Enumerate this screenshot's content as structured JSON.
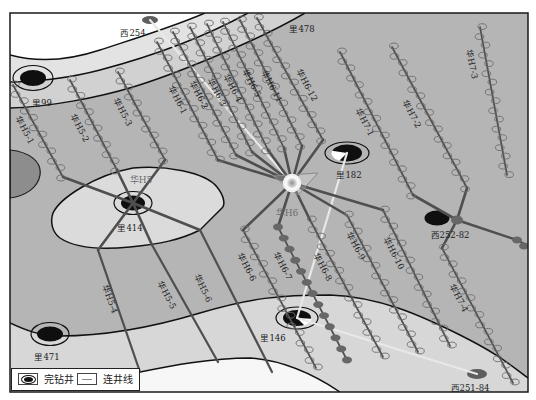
{
  "colors": {
    "trajectory": "#4f4f4f",
    "marker_stroke": "#6c6c6c",
    "marker_fill": "#676767",
    "tie_line": "#e8e8e8",
    "well_black": "#0f0f0f",
    "well_gray": "#5e5e5e",
    "pad_stroke": "#8a8a8a"
  },
  "map": {
    "frame": {
      "x": 10,
      "y": 13,
      "width": 518,
      "height": 379
    },
    "platforms": [
      {
        "name": "华H5",
        "x": 133,
        "y": 203,
        "symbol": "none",
        "label_pos": [
          141,
          180
        ]
      },
      {
        "name": "华H6",
        "x": 292,
        "y": 183,
        "symbol": "pad-glow",
        "label_pos": [
          287,
          213
        ],
        "triangle": [
          [
            273,
            176
          ],
          [
            318,
            173
          ],
          [
            298,
            195
          ]
        ]
      }
    ],
    "wells": [
      {
        "name": "西254",
        "x": 150,
        "y": 20,
        "symbol": "gray-dot",
        "core": [
          8,
          4
        ],
        "label_pos": [
          133,
          33
        ]
      },
      {
        "name": "里478",
        "symbol": "label-only",
        "label_pos": [
          302,
          29
        ]
      },
      {
        "name": "里99",
        "x": 33,
        "y": 78,
        "symbol": "ringed",
        "core": [
          13,
          8
        ],
        "ring": [
          20,
          12.5
        ],
        "label_pos": [
          42,
          103
        ]
      },
      {
        "name": "里182",
        "x": 347,
        "y": 153,
        "symbol": "ringed-pie",
        "core": [
          15,
          8.5
        ],
        "ring": [
          22,
          11
        ],
        "wedge": [
          120,
          195
        ],
        "label_pos": [
          349,
          175
        ]
      },
      {
        "name": "里414",
        "x": 133,
        "y": 203,
        "symbol": "ringed",
        "core": [
          12,
          7.5
        ],
        "ring": [
          19,
          11.5
        ],
        "label_pos": [
          130,
          228
        ]
      },
      {
        "name": "西252-82",
        "x": 437,
        "y": 218,
        "symbol": "black-dot",
        "core": [
          12.5,
          7.5
        ],
        "label_pos": [
          450,
          235
        ]
      },
      {
        "name": "里471",
        "x": 50,
        "y": 334,
        "symbol": "ringed",
        "core": [
          13,
          7.5
        ],
        "ring": [
          19,
          11.5
        ],
        "label_pos": [
          47,
          357
        ]
      },
      {
        "name": "里146",
        "x": 297,
        "y": 318,
        "symbol": "ringed-pie",
        "core": [
          14,
          8
        ],
        "ring": [
          21,
          11
        ],
        "wedge": [
          5,
          60
        ],
        "label_pos": [
          273,
          338
        ]
      },
      {
        "name": "西251-84",
        "x": 477,
        "y": 374,
        "symbol": "gray-dot",
        "core": [
          10,
          5
        ],
        "label_pos": [
          470,
          388
        ]
      }
    ],
    "horizontal_wells": [
      {
        "name": "华H5-1",
        "connector": [
          [
            133,
            203
          ],
          [
            63,
            177
          ]
        ],
        "chain": [
          [
            13,
            85
          ],
          [
            63,
            177
          ]
        ],
        "markers": "open",
        "label_pos": [
          25,
          130
        ],
        "rot": 62
      },
      {
        "name": "华H5-2",
        "connector": [
          [
            133,
            203
          ],
          [
            117,
            170
          ]
        ],
        "chain": [
          [
            70,
            80
          ],
          [
            117,
            170
          ]
        ],
        "markers": "open",
        "label_pos": [
          80,
          128
        ],
        "rot": 62
      },
      {
        "name": "华H5-3",
        "connector": [
          [
            133,
            203
          ],
          [
            165,
            160
          ]
        ],
        "chain": [
          [
            118,
            72
          ],
          [
            165,
            160
          ]
        ],
        "markers": "open",
        "label_pos": [
          123,
          112
        ],
        "rot": 62
      },
      {
        "name": "华H5-4",
        "connector": [
          [
            133,
            203
          ],
          [
            98,
            250
          ]
        ],
        "chain": [
          [
            98,
            250
          ],
          [
            140,
            372
          ]
        ],
        "markers": "none",
        "label_pos": [
          110,
          299
        ],
        "rot": 70
      },
      {
        "name": "华H5-5",
        "connector": [
          [
            133,
            203
          ],
          [
            152,
            245
          ]
        ],
        "chain": [
          [
            152,
            245
          ],
          [
            218,
            362
          ]
        ],
        "markers": "none",
        "label_pos": [
          167,
          295
        ],
        "rot": 62
      },
      {
        "name": "华H5-6",
        "connector": [
          [
            133,
            203
          ],
          [
            200,
            230
          ]
        ],
        "chain": [
          [
            200,
            230
          ],
          [
            272,
            372
          ]
        ],
        "markers": "none",
        "label_pos": [
          203,
          288
        ],
        "rot": 64
      },
      {
        "name": "华H6-1",
        "connector": [
          [
            292,
            183
          ],
          [
            218,
            160
          ]
        ],
        "chain": [
          [
            157,
            42
          ],
          [
            218,
            160
          ]
        ],
        "markers": "open",
        "label_pos": [
          178,
          100
        ],
        "rot": 62
      },
      {
        "name": "华H6-2",
        "connector": [
          [
            292,
            183
          ],
          [
            236,
            155
          ]
        ],
        "chain": [
          [
            173,
            32
          ],
          [
            236,
            155
          ]
        ],
        "markers": "open",
        "label_pos": [
          199,
          95
        ],
        "rot": 62
      },
      {
        "name": "华H6-3",
        "connector": [
          [
            292,
            183
          ],
          [
            252,
            152
          ]
        ],
        "chain": [
          [
            190,
            27
          ],
          [
            252,
            152
          ]
        ],
        "markers": "open",
        "label_pos": [
          217,
          92
        ],
        "rot": 63
      },
      {
        "name": "华H6-4",
        "connector": [
          [
            292,
            183
          ],
          [
            268,
            150
          ]
        ],
        "chain": [
          [
            207,
            24
          ],
          [
            268,
            150
          ]
        ],
        "markers": "open",
        "label_pos": [
          233,
          88
        ],
        "rot": 63
      },
      {
        "name": "华H6-5",
        "connector": [
          [
            292,
            183
          ],
          [
            284,
            148
          ]
        ],
        "chain": [
          [
            223,
            22
          ],
          [
            284,
            148
          ]
        ],
        "markers": "open",
        "label_pos": [
          252,
          83
        ],
        "rot": 63
      },
      {
        "name": "华H6-11",
        "connector": [
          [
            292,
            183
          ],
          [
            302,
            146
          ]
        ],
        "chain": [
          [
            240,
            20
          ],
          [
            302,
            146
          ]
        ],
        "markers": "open",
        "label_pos": [
          272,
          86
        ],
        "rot": 63
      },
      {
        "name": "华H6-12",
        "connector": [
          [
            292,
            183
          ],
          [
            323,
            140
          ]
        ],
        "chain": [
          [
            257,
            18
          ],
          [
            323,
            140
          ]
        ],
        "markers": "open",
        "label_pos": [
          307,
          85
        ],
        "rot": 62
      },
      {
        "name": "华H6-6",
        "connector": [
          [
            292,
            183
          ],
          [
            243,
            230
          ]
        ],
        "chain": [
          [
            243,
            230
          ],
          [
            316,
            368
          ]
        ],
        "markers": "open",
        "label_pos": [
          247,
          267
        ],
        "rot": 62
      },
      {
        "name": "华H6-7",
        "connector": [
          [
            292,
            183
          ],
          [
            278,
            227
          ]
        ],
        "chain": [
          [
            278,
            227
          ],
          [
            347,
            360
          ]
        ],
        "markers": "filled",
        "label_pos": [
          283,
          266
        ],
        "rot": 62
      },
      {
        "name": "华H6-8",
        "connector": [
          [
            292,
            183
          ],
          [
            310,
            220
          ]
        ],
        "chain": [
          [
            310,
            220
          ],
          [
            383,
            357
          ]
        ],
        "markers": "open",
        "label_pos": [
          323,
          267
        ],
        "rot": 62
      },
      {
        "name": "华H6-9",
        "connector": [
          [
            292,
            183
          ],
          [
            345,
            214
          ]
        ],
        "chain": [
          [
            347,
            215
          ],
          [
            418,
            352
          ]
        ],
        "markers": "open",
        "label_pos": [
          356,
          246
        ],
        "rot": 62
      },
      {
        "name": "华H6-10",
        "connector": [
          [
            292,
            183
          ],
          [
            383,
            210
          ]
        ],
        "chain": [
          [
            383,
            210
          ],
          [
            450,
            346
          ]
        ],
        "markers": "open",
        "label_pos": [
          394,
          253
        ],
        "rot": 63
      },
      {
        "name": "华H7-1",
        "connector": [
          [
            457,
            220
          ],
          [
            413,
            195
          ]
        ],
        "chain": [
          [
            340,
            52
          ],
          [
            413,
            195
          ]
        ],
        "markers": "open",
        "label_pos": [
          365,
          122
        ],
        "rot": 63
      },
      {
        "name": "华H7-2",
        "connector": [
          [
            457,
            220
          ],
          [
            467,
            188
          ]
        ],
        "chain": [
          [
            392,
            47
          ],
          [
            467,
            188
          ]
        ],
        "markers": "open",
        "label_pos": [
          412,
          114
        ],
        "rot": 62
      },
      {
        "name": "华H7-3",
        "connector": null,
        "chain": [
          [
            480,
            27
          ],
          [
            507,
            175
          ]
        ],
        "markers": "open",
        "label_pos": [
          472,
          64
        ],
        "rot": 78
      },
      {
        "name": "华H7-4",
        "connector": [
          [
            457,
            220
          ],
          [
            442,
            248
          ]
        ],
        "chain": [
          [
            442,
            248
          ],
          [
            513,
            383
          ]
        ],
        "markers": "open",
        "label_pos": [
          459,
          298
        ],
        "rot": 62
      }
    ],
    "junctions": [
      {
        "x": 457,
        "y": 220,
        "rx": 6,
        "ry": 4.5
      }
    ],
    "extensions": [
      {
        "path": [
          [
            457,
            220
          ],
          [
            517,
            240
          ],
          [
            528,
            246
          ]
        ],
        "dots": [
          [
            517,
            240
          ],
          [
            524,
            246
          ]
        ]
      }
    ],
    "tie_lines": [
      {
        "from": [
          150,
          20
        ],
        "to": [
          292,
          183
        ]
      },
      {
        "from": [
          347,
          153
        ],
        "to": [
          297,
          318
        ]
      },
      {
        "from": [
          297,
          318
        ],
        "to": [
          477,
          374
        ]
      }
    ]
  },
  "legend": {
    "items": [
      {
        "icon": "completed-well-icon",
        "label": "完钻井"
      },
      {
        "icon": "tie-line-icon",
        "label": "连井线"
      }
    ]
  }
}
